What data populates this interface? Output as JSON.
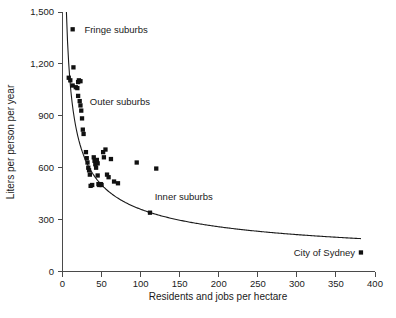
{
  "chart_data": {
    "type": "scatter",
    "title": "",
    "xlabel": "Residents and jobs per hectare",
    "ylabel": "Liters per person per year",
    "xlim": [
      0,
      400
    ],
    "ylim": [
      0,
      1500
    ],
    "grid": false,
    "xticks": [
      0,
      50,
      100,
      150,
      200,
      250,
      300,
      350,
      400
    ],
    "xticklabels": [
      "0",
      "50",
      "100",
      "150",
      "200",
      "250",
      "300",
      "350",
      "400"
    ],
    "yticks": [
      0,
      300,
      600,
      900,
      1200,
      1500
    ],
    "yticklabels": [
      "0",
      "300",
      "600",
      "900",
      "1,200",
      "1,500"
    ],
    "series": [
      {
        "name": "Suburbs and city areas",
        "marker": "square",
        "color": "#111111",
        "points": [
          [
            8,
            1120
          ],
          [
            10,
            1105
          ],
          [
            13,
            1075
          ],
          [
            14,
            1180
          ],
          [
            17,
            1065
          ],
          [
            19,
            1060
          ],
          [
            20,
            1095
          ],
          [
            21,
            1105
          ],
          [
            23,
            1100
          ],
          [
            20,
            1015
          ],
          [
            22,
            985
          ],
          [
            23,
            960
          ],
          [
            24,
            930
          ],
          [
            25,
            885
          ],
          [
            26,
            820
          ],
          [
            27,
            795
          ],
          [
            30,
            690
          ],
          [
            31,
            655
          ],
          [
            32,
            630
          ],
          [
            33,
            600
          ],
          [
            34,
            585
          ],
          [
            35,
            560
          ],
          [
            36,
            495
          ],
          [
            38,
            500
          ],
          [
            40,
            660
          ],
          [
            41,
            640
          ],
          [
            42,
            620
          ],
          [
            43,
            600
          ],
          [
            44,
            645
          ],
          [
            45,
            625
          ],
          [
            45,
            555
          ],
          [
            46,
            505
          ],
          [
            47,
            500
          ],
          [
            48,
            505
          ],
          [
            49,
            505
          ],
          [
            50,
            500
          ],
          [
            52,
            690
          ],
          [
            53,
            660
          ],
          [
            55,
            705
          ],
          [
            57,
            560
          ],
          [
            59,
            545
          ],
          [
            62,
            650
          ],
          [
            66,
            520
          ],
          [
            71,
            510
          ],
          [
            95,
            630
          ],
          [
            120,
            595
          ],
          [
            112,
            340
          ]
        ]
      }
    ],
    "fit_curve": {
      "name": "power-law trend",
      "description": "declining power-law fit through the data cloud",
      "x_start": 5,
      "x_end": 382,
      "y_start": 1500,
      "y_end": 190
    },
    "annotations": [
      {
        "id": "fringe-suburbs",
        "label": "Fringe suburbs",
        "marker": "square",
        "marker_x": 13,
        "marker_y": 1400,
        "text_x": 28,
        "text_y": 1400
      },
      {
        "id": "outer-suburbs",
        "label": "Outer suburbs",
        "marker": "none",
        "text_x": 35,
        "text_y": 985
      },
      {
        "id": "inner-suburbs",
        "label": "Inner suburbs",
        "marker": "none",
        "text_x": 118,
        "text_y": 435
      },
      {
        "id": "city-of-sydney",
        "label": "City of Sydney",
        "marker": "square",
        "marker_x": 382,
        "marker_y": 110,
        "text_x": 296,
        "text_y": 110
      }
    ]
  }
}
